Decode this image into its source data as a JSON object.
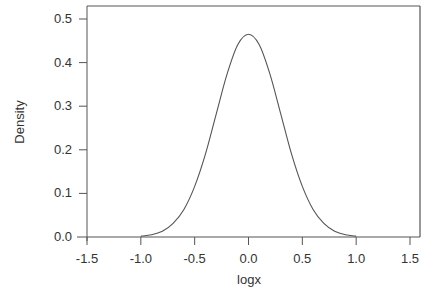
{
  "chart_data": {
    "type": "line",
    "title": "",
    "xlabel": "logx",
    "ylabel": "Density",
    "xlim": [
      -1.5,
      1.5
    ],
    "ylim": [
      0.0,
      0.5
    ],
    "x_ticks": [
      "-1.5",
      "-1.0",
      "-0.5",
      "0.0",
      "0.5",
      "1.0",
      "1.5"
    ],
    "y_ticks": [
      "0.0",
      "0.1",
      "0.2",
      "0.3",
      "0.4",
      "0.5"
    ],
    "grid": false,
    "legend": null,
    "series": [
      {
        "name": "density",
        "x": [
          -1.0,
          -0.9,
          -0.8,
          -0.7,
          -0.6,
          -0.5,
          -0.4,
          -0.3,
          -0.2,
          -0.1,
          0.0,
          0.1,
          0.2,
          0.3,
          0.4,
          0.5,
          0.6,
          0.7,
          0.8,
          0.9,
          1.0
        ],
        "values": [
          0.002,
          0.005,
          0.013,
          0.031,
          0.063,
          0.116,
          0.19,
          0.282,
          0.373,
          0.441,
          0.465,
          0.441,
          0.373,
          0.282,
          0.19,
          0.116,
          0.063,
          0.031,
          0.013,
          0.005,
          0.002
        ]
      }
    ],
    "colors": {
      "line": "#555555",
      "axis": "#555555",
      "text": "#333333"
    }
  }
}
